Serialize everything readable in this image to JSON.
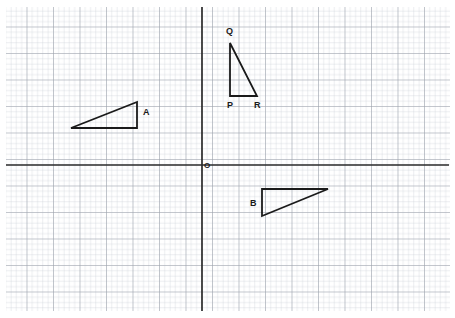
{
  "figure": {
    "width": 455,
    "height": 318,
    "background_color": "#ffffff"
  },
  "grid": {
    "minor_spacing_px": 5.3,
    "major_spacing_px": 26.5,
    "minor_color": "#c9ccd4",
    "major_color": "#9aa0ab",
    "left_px": 6,
    "top_px": 7,
    "right_px": 450,
    "bottom_px": 311
  },
  "axes": {
    "color": "#2b2b2b",
    "stroke_width": 1.6,
    "x_axis": {
      "y_px": 165,
      "x_start_px": 6,
      "x_end_px": 449
    },
    "y_axis": {
      "x_px": 202,
      "y_start_px": 7,
      "y_end_px": 311
    },
    "origin": {
      "x_px": 202,
      "y_px": 165,
      "label": "O",
      "label_x_px": 204,
      "label_y_px": 168
    }
  },
  "shapes": {
    "stroke_color": "#1a1a1a",
    "stroke_width": 1.8,
    "triangles": [
      {
        "name": "triangle-a",
        "label": "A",
        "label_x_px": 143,
        "label_y_px": 115,
        "points": "71,128 137,128 137,102",
        "vertices": [
          {
            "x_px": 71,
            "y_px": 128
          },
          {
            "x_px": 137,
            "y_px": 128
          },
          {
            "x_px": 137,
            "y_px": 102
          }
        ]
      },
      {
        "name": "triangle-pqr",
        "label": "",
        "label_x_px": 0,
        "label_y_px": 0,
        "points": "230,43 230,96 257,96",
        "vertices": [
          {
            "x_px": 230,
            "y_px": 43
          },
          {
            "x_px": 230,
            "y_px": 96
          },
          {
            "x_px": 257,
            "y_px": 96
          }
        ]
      },
      {
        "name": "triangle-b",
        "label": "B",
        "label_x_px": 250,
        "label_y_px": 206,
        "points": "262,189 328,189 262,216",
        "vertices": [
          {
            "x_px": 262,
            "y_px": 189
          },
          {
            "x_px": 328,
            "y_px": 189
          },
          {
            "x_px": 262,
            "y_px": 216
          }
        ]
      }
    ],
    "point_labels": [
      {
        "name": "vertex-label-q",
        "text": "Q",
        "x_px": 226,
        "y_px": 34
      },
      {
        "name": "vertex-label-p",
        "text": "P",
        "x_px": 227,
        "y_px": 108
      },
      {
        "name": "vertex-label-r",
        "text": "R",
        "x_px": 254,
        "y_px": 108
      }
    ]
  }
}
